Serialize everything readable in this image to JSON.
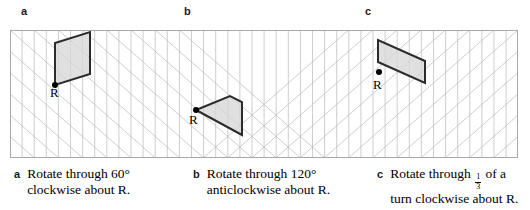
{
  "panels": [
    {
      "letter": "a"
    },
    {
      "letter": "b"
    },
    {
      "letter": "c"
    }
  ],
  "grid": {
    "type": "isometric-triangular-grid",
    "columns": 42,
    "rows": 6,
    "cell_width": 12.1,
    "cell_height": 21.3,
    "line_color": "#b9b9bc",
    "border_color": "#a8a8ac"
  },
  "shapes": [
    {
      "id": "shape-a",
      "name": "rhombus",
      "fill": "#d6d6d6",
      "stroke": "#2b2b2b",
      "points": "45,55 45,13 80,2 80,44",
      "marker_label": "R",
      "marker_x": 45,
      "marker_y": 55
    },
    {
      "id": "shape-b",
      "name": "quadrilateral",
      "fill": "#d6d6d6",
      "stroke": "#2b2b2b",
      "points": "186,80 220,66 232,72 232,105",
      "marker_label": "R",
      "marker_x": 186,
      "marker_y": 80
    },
    {
      "id": "shape-c",
      "name": "thin-parallelogram",
      "fill": "#d6d6d6",
      "stroke": "#2b2b2b",
      "points": "368,10 368,32 415,53 415,31",
      "marker_label": "R",
      "marker_x": 369,
      "marker_y": 42
    }
  ],
  "r_labels": [
    {
      "text": "R",
      "left": 50,
      "top": 86
    },
    {
      "text": "R",
      "left": 189,
      "top": 113
    },
    {
      "text": "R",
      "left": 373,
      "top": 78
    }
  ],
  "captions": [
    {
      "letter": "a",
      "line1": "Rotate through 60°",
      "line2": "clockwise about R."
    },
    {
      "letter": "b",
      "line1": "Rotate through 120°",
      "line2": "anticlockwise about R."
    },
    {
      "letter": "c",
      "line1_before": "Rotate through ",
      "fraction_numerator": "1",
      "fraction_denominator": "3",
      "line1_after": " of a",
      "line2": "turn clockwise about R."
    }
  ]
}
